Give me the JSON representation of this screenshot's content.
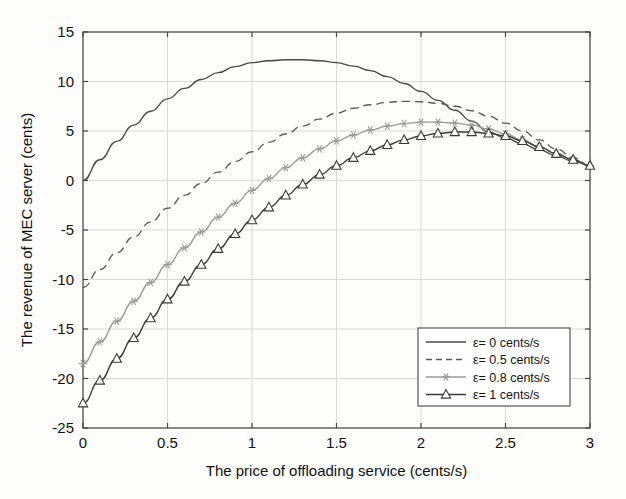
{
  "chart_data": {
    "type": "line",
    "title": "",
    "xlabel": "The price of offloading service (cents/s)",
    "ylabel": "The revenue of MEC server (cents)",
    "xlim": [
      0,
      3
    ],
    "ylim": [
      -25,
      15
    ],
    "xticks": [
      "0",
      "0.5",
      "1",
      "1.5",
      "2",
      "2.5",
      "3"
    ],
    "xtick_values": [
      0,
      0.5,
      1,
      1.5,
      2,
      2.5,
      3
    ],
    "yticks": [
      "15",
      "10",
      "5",
      "0",
      "-5",
      "-10",
      "-15",
      "-20",
      "-25"
    ],
    "ytick_values": [
      15,
      10,
      5,
      0,
      -5,
      -10,
      -15,
      -20,
      -25
    ],
    "grid": true,
    "legend_position": "lower right",
    "series": [
      {
        "name": "ε= 0 cents/s",
        "style": "solid",
        "marker": "none",
        "color": "#4a4a4a",
        "x": [
          0,
          0.1,
          0.2,
          0.3,
          0.4,
          0.5,
          0.6,
          0.7,
          0.8,
          0.9,
          1,
          1.1,
          1.2,
          1.3,
          1.4,
          1.5,
          1.6,
          1.7,
          1.8,
          1.9,
          2,
          2.1,
          2.2,
          2.3,
          2.4,
          2.5,
          2.6,
          2.7,
          2.8,
          2.9,
          3
        ],
        "y": [
          0,
          2.1,
          3.95,
          5.6,
          7.0,
          8.25,
          9.3,
          10.2,
          10.9,
          11.5,
          11.9,
          12.1,
          12.2,
          12.2,
          12.1,
          11.9,
          11.55,
          11.1,
          10.5,
          9.8,
          9.0,
          8.1,
          7.1,
          6.0,
          4.9,
          4.3,
          3.7,
          3.1,
          2.5,
          1.95,
          1.5
        ]
      },
      {
        "name": "ε= 0.5 cents/s",
        "style": "dashed",
        "marker": "none",
        "color": "#5a5a5a",
        "x": [
          0,
          0.1,
          0.2,
          0.3,
          0.4,
          0.5,
          0.6,
          0.7,
          0.8,
          0.9,
          1,
          1.1,
          1.2,
          1.3,
          1.4,
          1.5,
          1.6,
          1.7,
          1.8,
          1.9,
          2,
          2.1,
          2.2,
          2.3,
          2.4,
          2.5,
          2.6,
          2.7,
          2.8,
          2.9,
          3
        ],
        "y": [
          -10.8,
          -9.0,
          -7.3,
          -5.7,
          -4.2,
          -2.8,
          -1.5,
          -0.3,
          0.85,
          1.9,
          2.9,
          3.85,
          4.7,
          5.5,
          6.2,
          6.8,
          7.3,
          7.65,
          7.9,
          8.0,
          7.95,
          7.8,
          7.5,
          7.05,
          6.5,
          5.8,
          5.0,
          4.1,
          3.2,
          2.3,
          1.5
        ]
      },
      {
        "name": "ε= 0.8 cents/s",
        "style": "solid",
        "marker": "star",
        "color": "#9a9a9a",
        "x": [
          0,
          0.1,
          0.2,
          0.3,
          0.4,
          0.5,
          0.6,
          0.7,
          0.8,
          0.9,
          1,
          1.1,
          1.2,
          1.3,
          1.4,
          1.5,
          1.6,
          1.7,
          1.8,
          1.9,
          2,
          2.1,
          2.2,
          2.3,
          2.4,
          2.5,
          2.6,
          2.7,
          2.8,
          2.9,
          3
        ],
        "y": [
          -18.5,
          -16.3,
          -14.2,
          -12.2,
          -10.3,
          -8.5,
          -6.8,
          -5.2,
          -3.7,
          -2.3,
          -1.0,
          0.2,
          1.3,
          2.3,
          3.2,
          4.0,
          4.6,
          5.1,
          5.5,
          5.75,
          5.9,
          5.9,
          5.8,
          5.6,
          5.2,
          4.7,
          4.1,
          3.4,
          2.7,
          2.1,
          1.5
        ]
      },
      {
        "name": "ε= 1 cents/s",
        "style": "solid",
        "marker": "triangle",
        "color": "#3a3a3a",
        "x": [
          0,
          0.1,
          0.2,
          0.3,
          0.4,
          0.5,
          0.6,
          0.7,
          0.8,
          0.9,
          1,
          1.1,
          1.2,
          1.3,
          1.4,
          1.5,
          1.6,
          1.7,
          1.8,
          1.9,
          2,
          2.1,
          2.2,
          2.3,
          2.4,
          2.5,
          2.6,
          2.7,
          2.8,
          2.9,
          3
        ],
        "y": [
          -22.5,
          -20.2,
          -18.0,
          -15.9,
          -13.9,
          -12.0,
          -10.2,
          -8.5,
          -6.9,
          -5.4,
          -4.0,
          -2.7,
          -1.5,
          -0.4,
          0.6,
          1.5,
          2.3,
          3.0,
          3.6,
          4.1,
          4.5,
          4.75,
          4.9,
          4.9,
          4.75,
          4.5,
          4.0,
          3.4,
          2.7,
          2.1,
          1.5
        ]
      }
    ]
  }
}
